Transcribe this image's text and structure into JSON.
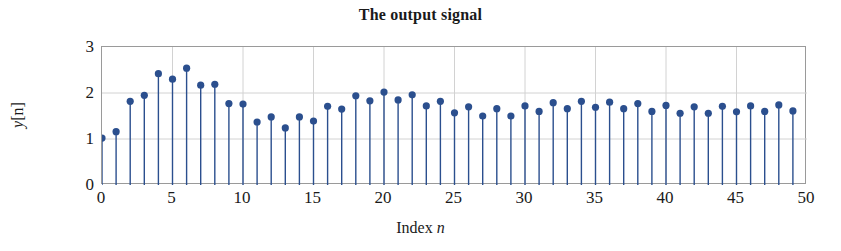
{
  "chart_data": {
    "type": "stem",
    "title": "The output signal",
    "xlabel": "Index n",
    "ylabel": "y[n]",
    "xlim": [
      0,
      50
    ],
    "ylim": [
      0,
      3
    ],
    "xticks": [
      0,
      5,
      10,
      15,
      20,
      25,
      30,
      35,
      40,
      45,
      50
    ],
    "yticks": [
      0,
      1,
      2,
      3
    ],
    "grid": true,
    "legend": null,
    "marker_color": "#2b4f8e",
    "stem_color": "#2b4f8e",
    "grid_color": "#d2d2d2",
    "axis_color": "#9a9a9a",
    "x": [
      0,
      1,
      2,
      3,
      4,
      5,
      6,
      7,
      8,
      9,
      10,
      11,
      12,
      13,
      14,
      15,
      16,
      17,
      18,
      19,
      20,
      21,
      22,
      23,
      24,
      25,
      26,
      27,
      28,
      29,
      30,
      31,
      32,
      33,
      34,
      35,
      36,
      37,
      38,
      39,
      40,
      41,
      42,
      43,
      44,
      45,
      46,
      47,
      48,
      49
    ],
    "values": [
      1.02,
      1.16,
      1.82,
      1.95,
      2.42,
      2.3,
      2.54,
      2.17,
      2.19,
      1.77,
      1.76,
      1.37,
      1.48,
      1.24,
      1.48,
      1.39,
      1.71,
      1.65,
      1.94,
      1.83,
      2.02,
      1.85,
      1.96,
      1.72,
      1.82,
      1.57,
      1.7,
      1.5,
      1.66,
      1.5,
      1.72,
      1.6,
      1.79,
      1.66,
      1.82,
      1.69,
      1.8,
      1.66,
      1.77,
      1.6,
      1.73,
      1.56,
      1.7,
      1.56,
      1.71,
      1.59,
      1.72,
      1.6,
      1.74,
      1.61
    ]
  },
  "axis": {
    "ytick_labels": [
      "0",
      "1",
      "2",
      "3"
    ],
    "xtick_labels": [
      "0",
      "5",
      "10",
      "15",
      "20",
      "25",
      "30",
      "35",
      "40",
      "45",
      "50"
    ],
    "xlabel_text": "Index ",
    "xlabel_var": "n",
    "ylabel_text": "[n]",
    "ylabel_var": "y"
  }
}
